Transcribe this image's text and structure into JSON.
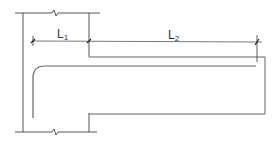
{
  "diagram": {
    "type": "reinforcement-detail",
    "colors": {
      "line": "#555555",
      "bar": "#666666",
      "background": "#ffffff"
    },
    "dimensions": [
      {
        "id": "L1",
        "letter": "L",
        "subscript": "1"
      },
      {
        "id": "L2",
        "letter": "L",
        "subscript": "2"
      }
    ]
  }
}
